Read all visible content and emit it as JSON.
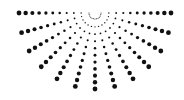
{
  "graphic": {
    "name": "dotted-half-sunburst",
    "background": "#ffffff",
    "dot_color": "#111111",
    "center": [
      95,
      13
    ],
    "ray_count": 13,
    "angle_start_deg": 0,
    "angle_end_deg": 180,
    "dots_per_ray": 11,
    "inner_radius": 6,
    "outer_radius": 76,
    "min_dot_radius": 0.5,
    "max_dot_radius": 2.4
  }
}
